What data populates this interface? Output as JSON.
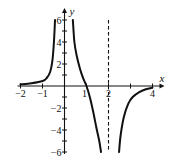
{
  "chart_data": {
    "type": "line",
    "title": "",
    "xlabel": "x",
    "ylabel": "y",
    "xlim": [
      -2,
      4
    ],
    "ylim": [
      -6,
      6
    ],
    "x_ticks": [
      -2,
      -1,
      1,
      2,
      3,
      4
    ],
    "x_tick_labels": [
      "-2",
      "-1",
      "1",
      "2",
      "4"
    ],
    "y_ticks": [
      -6,
      -5,
      -4,
      -3,
      -2,
      -1,
      1,
      2,
      3,
      4,
      5,
      6
    ],
    "y_tick_labels": [
      "6",
      "4",
      "2",
      "-2",
      "-4",
      "-6"
    ],
    "grid": false,
    "vertical_asymptotes": [
      {
        "x": 0,
        "style": "none (y-axis)"
      },
      {
        "x": 2,
        "style": "dashed"
      }
    ],
    "horizontal_asymptote": 0,
    "series": [
      {
        "name": "left-branch",
        "points": [
          [
            -2,
            0.15
          ],
          [
            -1.5,
            0.25
          ],
          [
            -1,
            0.45
          ],
          [
            -0.8,
            0.75
          ],
          [
            -0.65,
            1.3
          ],
          [
            -0.55,
            2.3
          ],
          [
            -0.48,
            4
          ],
          [
            -0.43,
            6
          ]
        ]
      },
      {
        "name": "middle-branch",
        "points": [
          [
            0.38,
            6
          ],
          [
            0.45,
            4
          ],
          [
            0.55,
            2.8
          ],
          [
            0.7,
            1.6
          ],
          [
            0.85,
            0.7
          ],
          [
            1,
            0
          ],
          [
            1.15,
            -1
          ],
          [
            1.3,
            -2.3
          ],
          [
            1.45,
            -3.8
          ],
          [
            1.58,
            -5
          ],
          [
            1.66,
            -6
          ]
        ]
      },
      {
        "name": "right-branch",
        "points": [
          [
            2.48,
            -6
          ],
          [
            2.55,
            -4.5
          ],
          [
            2.7,
            -2.8
          ],
          [
            2.9,
            -1.6
          ],
          [
            3.1,
            -1.0
          ],
          [
            3.4,
            -0.55
          ],
          [
            3.7,
            -0.3
          ],
          [
            4,
            -0.15
          ]
        ]
      }
    ]
  }
}
